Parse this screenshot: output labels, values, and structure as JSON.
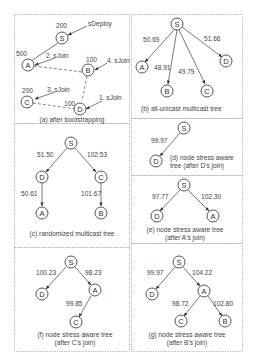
{
  "figure": {
    "panels": [
      {
        "id": "a",
        "caption": "(a) after bootstrapping",
        "nodes": [
          {
            "id": "S",
            "label": "S",
            "value": "200"
          },
          {
            "id": "A",
            "label": "A",
            "value": "500"
          },
          {
            "id": "B",
            "label": "B",
            "value": "100"
          },
          {
            "id": "C",
            "label": "C",
            "value": "200"
          },
          {
            "id": "D",
            "label": "D",
            "value": "100"
          }
        ],
        "events": [
          {
            "label": "sDeploy",
            "target": "S"
          },
          {
            "label": "1. sJoin",
            "target": "D"
          },
          {
            "label": "2. sJoin",
            "target": "A"
          },
          {
            "label": "3. sJoin",
            "target": "C"
          },
          {
            "label": "4. sJoin",
            "target": "B"
          }
        ],
        "links": [
          [
            "S",
            "A",
            "solid"
          ],
          [
            "A",
            "B",
            "dashed"
          ],
          [
            "B",
            "D",
            "dashed"
          ],
          [
            "C",
            "D",
            "dashed"
          ]
        ]
      },
      {
        "id": "b",
        "caption": "(b) all-unicast multicast tree",
        "edges": [
          {
            "from": "S",
            "to": "A",
            "weight": "50.69"
          },
          {
            "from": "S",
            "to": "B",
            "weight": "48.91"
          },
          {
            "from": "S",
            "to": "C",
            "weight": "49.79"
          },
          {
            "from": "S",
            "to": "D",
            "weight": "51.66"
          }
        ]
      },
      {
        "id": "c",
        "caption": "(c) randomized multicast tree",
        "edges": [
          {
            "from": "S",
            "to": "D",
            "weight": "51.50"
          },
          {
            "from": "S",
            "to": "C",
            "weight": "102.53"
          },
          {
            "from": "D",
            "to": "A",
            "weight": "50.61"
          },
          {
            "from": "C",
            "to": "B",
            "weight": "101.67"
          }
        ]
      },
      {
        "id": "d",
        "caption_line1": "(d) node stress aware",
        "caption_line2": "tree (after D's join)",
        "edges": [
          {
            "from": "S",
            "to": "D",
            "weight": "99.97"
          }
        ]
      },
      {
        "id": "e",
        "caption_line1": "(e) node stress aware tree",
        "caption_line2": "(after A's join)",
        "edges": [
          {
            "from": "S",
            "to": "D",
            "weight": "97.77"
          },
          {
            "from": "S",
            "to": "A",
            "weight": "102.30"
          }
        ]
      },
      {
        "id": "f",
        "caption_line1": "(f) node stress aware tree",
        "caption_line2": "(after C's join)",
        "edges": [
          {
            "from": "S",
            "to": "D",
            "weight": "100.23"
          },
          {
            "from": "S",
            "to": "A",
            "weight": "98.23"
          },
          {
            "from": "A",
            "to": "C",
            "weight": "99.85"
          }
        ]
      },
      {
        "id": "g",
        "caption_line1": "(g) node stress aware tree",
        "caption_line2": "(after B's join)",
        "edges": [
          {
            "from": "S",
            "to": "D",
            "weight": "99.97"
          },
          {
            "from": "S",
            "to": "A",
            "weight": "104.22"
          },
          {
            "from": "A",
            "to": "C",
            "weight": "98.72"
          },
          {
            "from": "A",
            "to": "B",
            "weight": "102.80"
          }
        ]
      }
    ]
  }
}
